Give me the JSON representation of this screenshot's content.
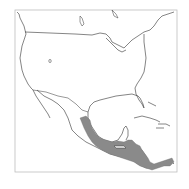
{
  "map": {
    "type": "species-range-map",
    "region": "North and Central America",
    "frame": {
      "x": 15,
      "y": 10,
      "width": 162,
      "height": 162
    },
    "colors": {
      "range_fill": "#8a8a8a",
      "coastline": "#333333",
      "frame": "#bdbdbd",
      "background": "#ffffff"
    },
    "highlighted_range": "Eastern Mexico lowlands through Central America to Panama",
    "labels": []
  }
}
